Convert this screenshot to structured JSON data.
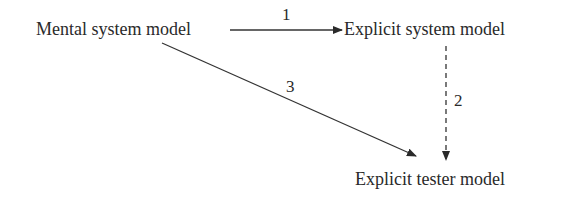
{
  "diagram": {
    "nodes": [
      {
        "id": "mental",
        "label": "Mental system model"
      },
      {
        "id": "explicit_system",
        "label": "Explicit system model"
      },
      {
        "id": "explicit_tester",
        "label": "Explicit tester model"
      }
    ],
    "edges": [
      {
        "id": "e1",
        "from": "mental",
        "to": "explicit_system",
        "label": "1",
        "style": "solid"
      },
      {
        "id": "e2",
        "from": "explicit_system",
        "to": "explicit_tester",
        "label": "2",
        "style": "dashed"
      },
      {
        "id": "e3",
        "from": "mental",
        "to": "explicit_tester",
        "label": "3",
        "style": "solid"
      }
    ],
    "colors": {
      "stroke": "#333333",
      "text": "#2a2a2a",
      "background": "#ffffff"
    }
  }
}
